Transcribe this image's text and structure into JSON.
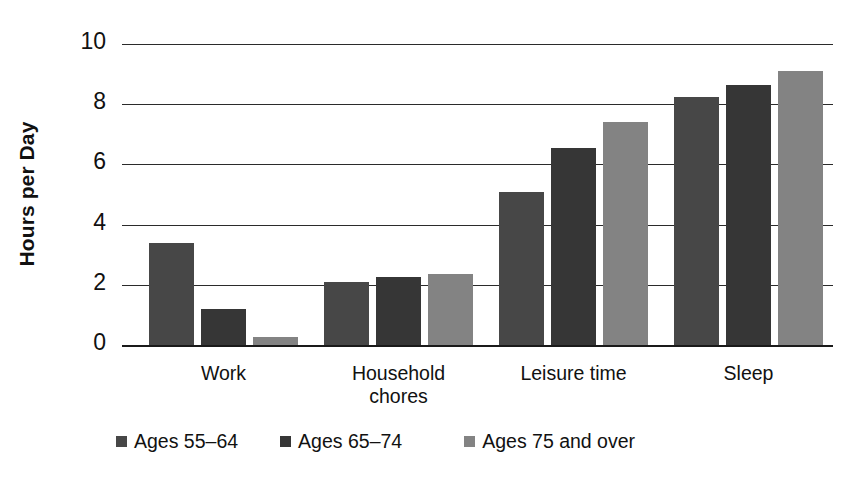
{
  "chart_data": {
    "type": "bar",
    "title": "",
    "subtitle": "",
    "xlabel": "",
    "ylabel": "Hours per Day",
    "ylim": [
      0,
      10
    ],
    "yticks": [
      0,
      2,
      4,
      6,
      8,
      10
    ],
    "ytick_labels": [
      "0",
      "2",
      "4",
      "6",
      "8",
      "10"
    ],
    "grid": true,
    "grid_axis": "y",
    "legend_position": "bottom",
    "categories": [
      "Work",
      "Household chores",
      "Leisure time",
      "Sleep"
    ],
    "category_label_lines": [
      [
        "Work"
      ],
      [
        "Household",
        "chores"
      ],
      [
        "Leisure time"
      ],
      [
        "Sleep"
      ]
    ],
    "series": [
      {
        "name": "Ages 55–64",
        "color": "#474747",
        "values": [
          3.4,
          2.1,
          5.1,
          8.25
        ]
      },
      {
        "name": "Ages 65–74",
        "color": "#363636",
        "values": [
          1.2,
          2.25,
          6.55,
          8.65
        ]
      },
      {
        "name": "Ages 75 and over",
        "color": "#838383",
        "values": [
          0.25,
          2.35,
          7.4,
          9.1
        ]
      }
    ]
  },
  "legend": {
    "items": [
      {
        "label": "Ages 55–64",
        "color": "#474747"
      },
      {
        "label": "Ages 65–74",
        "color": "#363636"
      },
      {
        "label": "Ages 75 and over",
        "color": "#838383"
      }
    ]
  },
  "axes": {
    "y_title": "Hours per Day"
  }
}
